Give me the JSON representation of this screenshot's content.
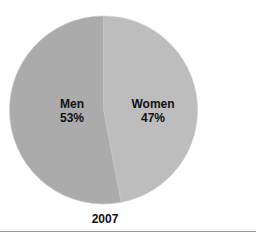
{
  "chart_data": {
    "type": "pie",
    "title": "",
    "caption": "2007",
    "categories": [
      "Women",
      "Men"
    ],
    "values": [
      47,
      53
    ],
    "unit": "%",
    "colors": [
      "#bdbdbd",
      "#ababab"
    ],
    "labels": [
      {
        "name": "Women",
        "value_text": "47%"
      },
      {
        "name": "Men",
        "value_text": "53%"
      }
    ],
    "start_angle_deg": 0,
    "direction": "clockwise",
    "legend": "none (labels inside slices)"
  }
}
